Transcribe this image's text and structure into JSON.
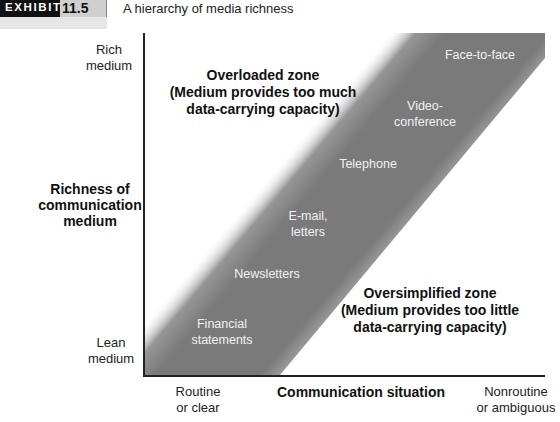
{
  "header": {
    "exhibit_word": "EXHIBIT",
    "exhibit_number": "11.5",
    "title": "A hierarchy of media richness"
  },
  "y_axis": {
    "title_lines": [
      "Richness of",
      "communication",
      "medium"
    ],
    "top_label": [
      "Rich",
      "medium"
    ],
    "bottom_label": [
      "Lean",
      "medium"
    ]
  },
  "x_axis": {
    "title": "Communication situation",
    "left_label": [
      "Routine",
      "or clear"
    ],
    "right_label": [
      "Nonroutine",
      "or ambiguous"
    ]
  },
  "zones": {
    "overloaded": [
      "Overloaded zone",
      "(Medium provides too much",
      "data-carrying capacity)"
    ],
    "oversimplified": [
      "Oversimplified zone",
      "(Medium provides too little",
      "data-carrying capacity)"
    ]
  },
  "media": [
    {
      "lines": [
        "Face-to-face"
      ]
    },
    {
      "lines": [
        "Video-",
        "conference"
      ]
    },
    {
      "lines": [
        "Telephone"
      ]
    },
    {
      "lines": [
        "E-mail,",
        "letters"
      ]
    },
    {
      "lines": [
        "Newsletters"
      ]
    },
    {
      "lines": [
        "Financial",
        "statements"
      ]
    }
  ],
  "colors": {
    "band": "#7a7a7a",
    "axis": "#222222",
    "exhibit_black": "#111111",
    "exhibit_gray": "#cfcfcf"
  }
}
